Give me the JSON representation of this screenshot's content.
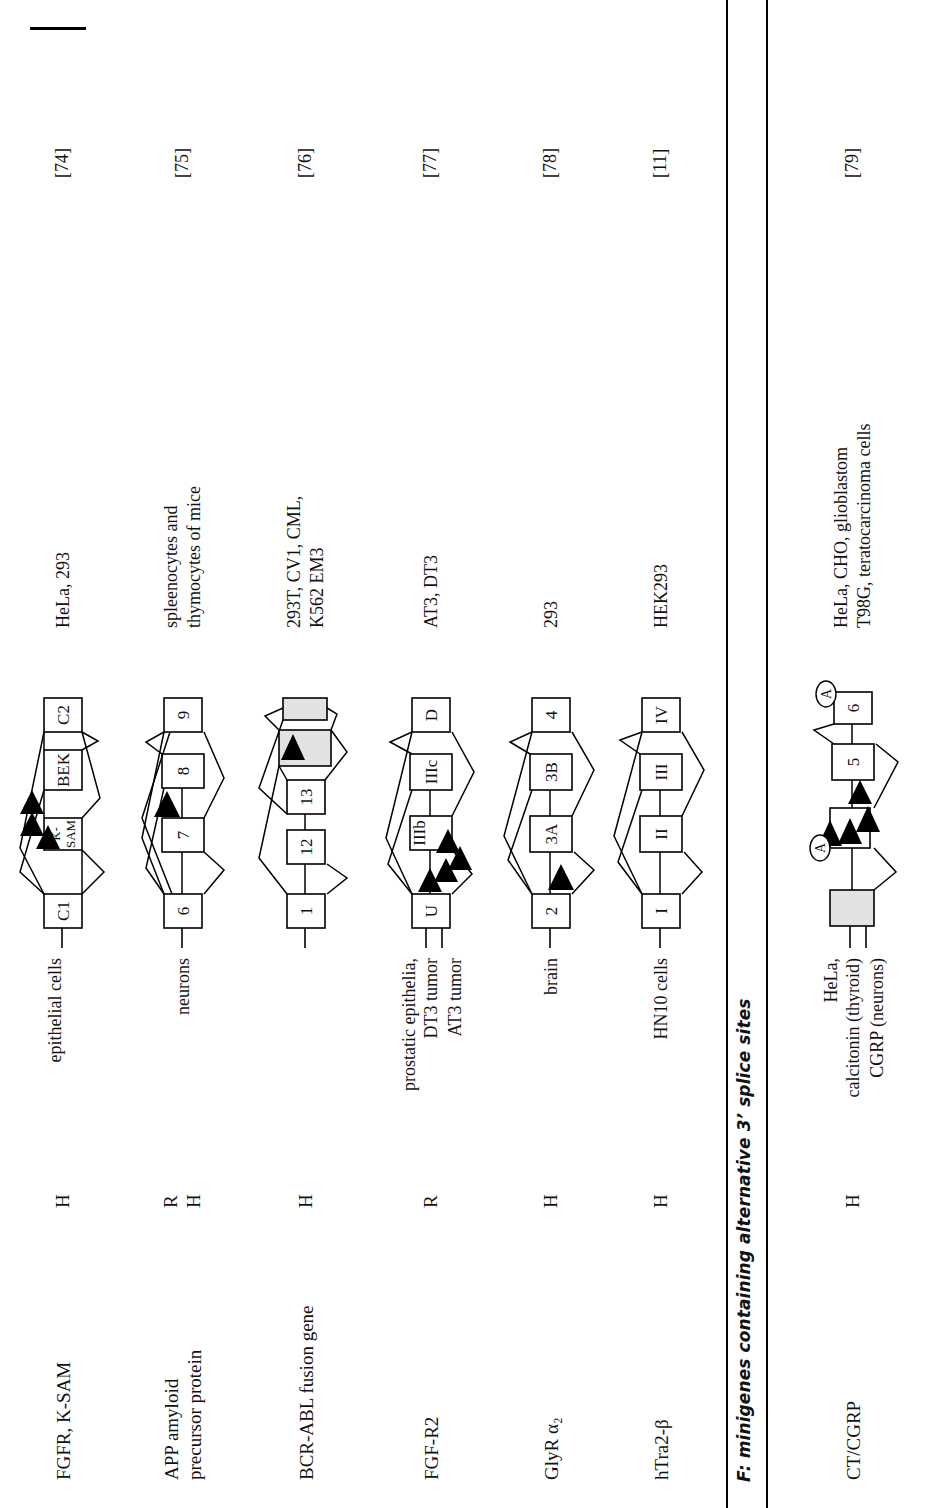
{
  "figure": {
    "section_title": "F: minigenes containing alternative 3’ splice sites",
    "page_mark": "page-edge-mark"
  },
  "rows": [
    {
      "id": "fgfr-ksam",
      "gene_line1": "FGFR, K-SAM",
      "gene_line2": "",
      "species": [
        "H"
      ],
      "tissues": [
        "epithelial cells"
      ],
      "cells": [
        "HeLa, 293"
      ],
      "ref": "[74]",
      "exons": [
        {
          "label": "C1",
          "grey": false,
          "small": false
        },
        {
          "label": "K-\nSAM",
          "grey": false,
          "small": true
        },
        {
          "label": "BEK",
          "grey": false,
          "small": false
        },
        {
          "label": "C2",
          "grey": false,
          "small": false
        }
      ]
    },
    {
      "id": "app-amyloid",
      "gene_line1": "APP amyloid",
      "gene_line2": "precursor protein",
      "species": [
        "R",
        "H"
      ],
      "tissues": [
        "neurons"
      ],
      "cells": [
        "spleenocytes and",
        "thymocytes of mice"
      ],
      "ref": "[75]",
      "exons": [
        {
          "label": "6",
          "grey": false,
          "small": false
        },
        {
          "label": "7",
          "grey": false,
          "small": false
        },
        {
          "label": "8",
          "grey": false,
          "small": false
        },
        {
          "label": "9",
          "grey": false,
          "small": false
        }
      ]
    },
    {
      "id": "bcr-abl",
      "gene_line1": "BCR-ABL fusion gene",
      "gene_line2": "",
      "species": [
        "H"
      ],
      "tissues": [],
      "cells": [
        "293T, CV1, CML,",
        "K562 EM3"
      ],
      "ref": "[76]",
      "exons": [
        {
          "label": "1",
          "grey": false,
          "small": false
        },
        {
          "label": "12",
          "grey": false,
          "small": false
        },
        {
          "label": "13",
          "grey": false,
          "small": false
        },
        {
          "label": "",
          "grey": true,
          "small": false
        },
        {
          "label": "",
          "grey": true,
          "small": false
        }
      ]
    },
    {
      "id": "fgf-r2",
      "gene_line1": "FGF-R2",
      "gene_line2": "",
      "species": [
        "R"
      ],
      "tissues": [
        "prostatic epithelia,",
        "DT3 tumor",
        "AT3 tumor"
      ],
      "cells": [
        "AT3, DT3"
      ],
      "ref": "[77]",
      "exons": [
        {
          "label": "U",
          "grey": false,
          "small": false
        },
        {
          "label": "IIIb",
          "grey": false,
          "small": false
        },
        {
          "label": "IIIc",
          "grey": false,
          "small": false
        },
        {
          "label": "D",
          "grey": false,
          "small": false
        }
      ]
    },
    {
      "id": "glyr-alpha2",
      "gene_line1": "GlyR α₂",
      "gene_line2": "",
      "species": [
        "H"
      ],
      "tissues": [
        "brain"
      ],
      "cells": [
        "293"
      ],
      "ref": "[78]",
      "exons": [
        {
          "label": "2",
          "grey": false,
          "small": false
        },
        {
          "label": "3A",
          "grey": false,
          "small": false
        },
        {
          "label": "3B",
          "grey": false,
          "small": false
        },
        {
          "label": "4",
          "grey": false,
          "small": false
        }
      ]
    },
    {
      "id": "htra2-beta",
      "gene_line1": "hTra2-β",
      "gene_line2": "",
      "species": [
        "H"
      ],
      "tissues": [
        "HN10 cells"
      ],
      "cells": [
        "HEK293"
      ],
      "ref": "[11]",
      "exons": [
        {
          "label": "I",
          "grey": false,
          "small": false
        },
        {
          "label": "II",
          "grey": false,
          "small": false
        },
        {
          "label": "III",
          "grey": false,
          "small": false
        },
        {
          "label": "IV",
          "grey": false,
          "small": false
        }
      ]
    },
    {
      "id": "ct-cgrp",
      "gene_line1": "CT/CGRP",
      "gene_line2": "",
      "species": [
        "H"
      ],
      "tissues": [
        "HeLa,",
        "calcitonin (thyroid)",
        "CGRP (neurons)"
      ],
      "cells": [
        "HeLa, CHO, glioblastom",
        "T98G, teratocarcinoma cells"
      ],
      "ref": "[79]",
      "exons": [
        {
          "label": "",
          "grey": true,
          "small": false
        },
        {
          "label": "",
          "grey": false,
          "small": false
        },
        {
          "label": "5",
          "grey": false,
          "small": false
        },
        {
          "label": "6",
          "grey": false,
          "small": false
        }
      ],
      "annotations": [
        "A",
        "A"
      ]
    }
  ]
}
